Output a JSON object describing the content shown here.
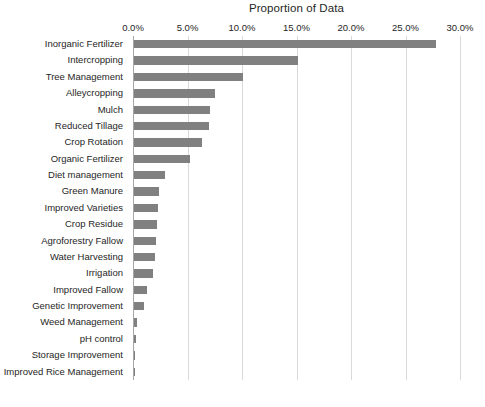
{
  "chart_data": {
    "type": "bar",
    "orientation": "horizontal",
    "title": "Proportion of Data",
    "xlabel": "",
    "ylabel": "",
    "xlim": [
      0,
      30
    ],
    "x_tick_labels": [
      "0.0%",
      "5.0%",
      "10.0%",
      "15.0%",
      "20.0%",
      "25.0%",
      "30.0%"
    ],
    "x_tick_values": [
      0,
      5,
      10,
      15,
      20,
      25,
      30
    ],
    "grid": true,
    "grid_axis": "x",
    "legend": false,
    "axis_position": "top",
    "bar_color": "#808080",
    "categories": [
      "Inorganic Fertilizer",
      "Intercropping",
      "Tree Management",
      "Alleycropping",
      "Mulch",
      "Reduced Tillage",
      "Crop Rotation",
      "Organic Fertilizer",
      "Diet management",
      "Green Manure",
      "Improved Varieties",
      "Crop Residue",
      "Agroforestry Fallow",
      "Water Harvesting",
      "Irrigation",
      "Improved Fallow",
      "Genetic Improvement",
      "Weed Management",
      "pH control",
      "Storage Improvement",
      "Improved Rice Management"
    ],
    "values": [
      27.7,
      15.0,
      10.0,
      7.4,
      7.0,
      6.9,
      6.2,
      5.1,
      2.8,
      2.3,
      2.2,
      2.1,
      2.0,
      1.9,
      1.7,
      1.2,
      0.9,
      0.3,
      0.15,
      0.1,
      0.05
    ],
    "value_unit": "%"
  }
}
